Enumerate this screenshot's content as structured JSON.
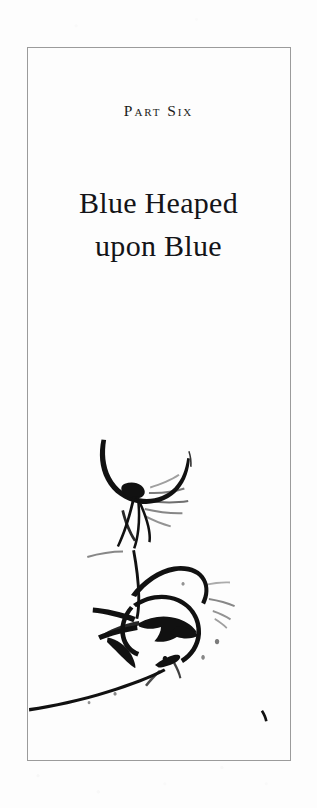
{
  "page": {
    "background_color": "#fdfdfd",
    "width": 317,
    "height": 808
  },
  "frame": {
    "border_color": "#9b9b9b",
    "border_width": 1
  },
  "part": {
    "label": "Part Six",
    "title_line_1": "Blue Heaped",
    "title_line_2": "upon Blue",
    "text_color": "#141418"
  },
  "illustration": {
    "name": "sumi-e-ink-brush-drawing",
    "ink_color": "#111111",
    "description": "Loose monochrome ink brush drawing: a sweeping upper arc with a dark blob, a swirling circular mass of bold strokes below it, a long tapering trailing stroke, and a small ink speck at lower right."
  }
}
